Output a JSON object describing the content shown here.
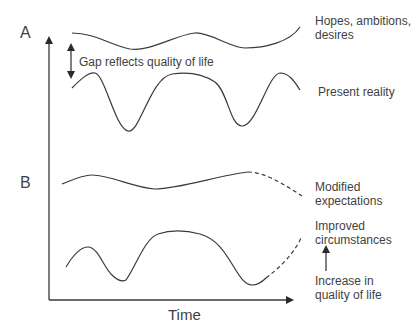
{
  "diagram": {
    "panels": [
      {
        "id": "A",
        "label": "A"
      },
      {
        "id": "B",
        "label": "B"
      }
    ],
    "axis": {
      "x_label": "Time",
      "y_label": ""
    },
    "annotations": {
      "gap": "Gap reflects quality of life"
    },
    "curve_labels": {
      "hopes_line1": "Hopes, ambitions,",
      "hopes_line2": "desires",
      "present": "Present reality",
      "modified_line1": "Modified",
      "modified_line2": "expectations",
      "improved_line1": "Improved",
      "improved_line2": "circumstances",
      "increase_line1": "Increase in",
      "increase_line2": "quality of life"
    },
    "colors": {
      "line": "#3a3a3a",
      "text": "#3f3f3f",
      "background": "#ffffff"
    }
  }
}
